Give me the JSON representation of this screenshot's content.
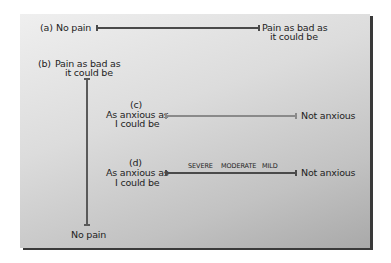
{
  "scale_a": {
    "tag": "(a)",
    "left_label": "No pain",
    "right_label_line1": "Pain as bad as",
    "right_label_line2": "it could be"
  },
  "scale_b": {
    "tag": "(b)",
    "top_label_line1": "Pain as bad as",
    "top_label_line2": "it could be",
    "bottom_label": "No pain"
  },
  "scale_c": {
    "tag": "(c)",
    "left_label_line1": "As anxious as",
    "left_label_line2": "I could be",
    "right_label": "Not anxious"
  },
  "scale_d": {
    "tag": "(d)",
    "left_label_line1": "As anxious as",
    "left_label_line2": "I could be",
    "right_label": "Not anxious",
    "descriptors": [
      "SEVERE",
      "MODERATE",
      "MILD"
    ]
  },
  "colors": {
    "line_dark": "#4a4a4a",
    "line_light": "#8a8a8a",
    "panel_light": "#efefef",
    "panel_dark": "#a9a9a9",
    "shadow": "#3a3a3a"
  }
}
